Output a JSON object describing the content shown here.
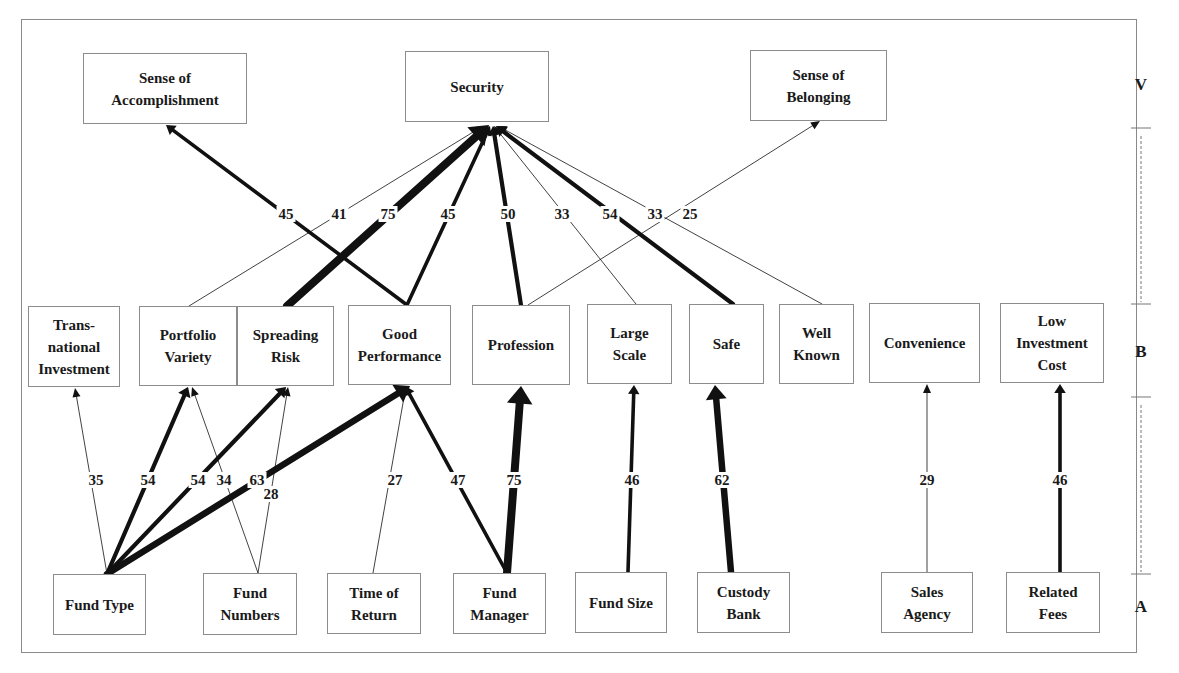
{
  "diagram": {
    "type": "hierarchical-value-map",
    "levels": [
      {
        "id": "V",
        "label": "V",
        "x": 1141,
        "y": 86
      },
      {
        "id": "B",
        "label": "B",
        "x": 1141,
        "y": 353
      },
      {
        "id": "A",
        "label": "A",
        "x": 1141,
        "y": 608
      }
    ],
    "level_brackets": [
      {
        "x": 1141,
        "y1": 128,
        "y2": 304
      },
      {
        "x": 1141,
        "y1": 397,
        "y2": 574
      }
    ],
    "nodes": [
      {
        "id": "accomplishment",
        "label": "Sense of\nAccomplishment",
        "level": "V",
        "x": 83,
        "y": 53,
        "w": 164,
        "h": 71
      },
      {
        "id": "security",
        "label": "Security",
        "level": "V",
        "x": 405,
        "y": 51,
        "w": 144,
        "h": 71
      },
      {
        "id": "belonging",
        "label": "Sense of\nBelonging",
        "level": "V",
        "x": 750,
        "y": 50,
        "w": 137,
        "h": 71
      },
      {
        "id": "transnational",
        "label": "Trans-\nnational\nInvestment",
        "level": "B",
        "x": 28,
        "y": 306,
        "w": 92,
        "h": 81
      },
      {
        "id": "portfolio",
        "label": "Portfolio\nVariety",
        "level": "B",
        "x": 139,
        "y": 306,
        "w": 98,
        "h": 80
      },
      {
        "id": "spreading",
        "label": "Spreading\nRisk",
        "level": "B",
        "x": 237,
        "y": 306,
        "w": 97,
        "h": 80
      },
      {
        "id": "performance",
        "label": "Good\nPerformance",
        "level": "B",
        "x": 348,
        "y": 305,
        "w": 103,
        "h": 80
      },
      {
        "id": "profession",
        "label": "Profession",
        "level": "B",
        "x": 472,
        "y": 305,
        "w": 98,
        "h": 80
      },
      {
        "id": "largescale",
        "label": "Large\nScale",
        "level": "B",
        "x": 587,
        "y": 304,
        "w": 85,
        "h": 80
      },
      {
        "id": "safe",
        "label": "Safe",
        "level": "B",
        "x": 689,
        "y": 304,
        "w": 75,
        "h": 80
      },
      {
        "id": "wellknown",
        "label": "Well\nKnown",
        "level": "B",
        "x": 779,
        "y": 304,
        "w": 75,
        "h": 80
      },
      {
        "id": "convenience",
        "label": "Convenience",
        "level": "B",
        "x": 869,
        "y": 303,
        "w": 111,
        "h": 80
      },
      {
        "id": "lowcost",
        "label": "Low\nInvestment\nCost",
        "level": "B",
        "x": 1000,
        "y": 303,
        "w": 104,
        "h": 80
      },
      {
        "id": "fundtype",
        "label": "Fund Type",
        "level": "A",
        "x": 53,
        "y": 574,
        "w": 93,
        "h": 61
      },
      {
        "id": "fundnumbers",
        "label": "Fund\nNumbers",
        "level": "A",
        "x": 203,
        "y": 573,
        "w": 94,
        "h": 62
      },
      {
        "id": "timereturn",
        "label": "Time of\nReturn",
        "level": "A",
        "x": 327,
        "y": 573,
        "w": 94,
        "h": 61
      },
      {
        "id": "fundmanager",
        "label": "Fund\nManager",
        "level": "A",
        "x": 453,
        "y": 573,
        "w": 93,
        "h": 61
      },
      {
        "id": "fundsize",
        "label": "Fund Size",
        "level": "A",
        "x": 575,
        "y": 572,
        "w": 92,
        "h": 61
      },
      {
        "id": "custody",
        "label": "Custody\nBank",
        "level": "A",
        "x": 697,
        "y": 572,
        "w": 93,
        "h": 61
      },
      {
        "id": "salesagency",
        "label": "Sales\nAgency",
        "level": "A",
        "x": 881,
        "y": 572,
        "w": 92,
        "h": 61
      },
      {
        "id": "relatedfees",
        "label": "Related\nFees",
        "level": "A",
        "x": 1006,
        "y": 572,
        "w": 94,
        "h": 61
      }
    ],
    "edges": [
      {
        "from": "performance",
        "to": "accomplishment",
        "value": 45,
        "x1": 407,
        "y1": 305,
        "x2": 166,
        "y2": 125,
        "lx": 286,
        "ly": 214
      },
      {
        "from": "portfolio",
        "to": "security",
        "value": 41,
        "x1": 189,
        "y1": 306,
        "x2": 483,
        "y2": 126,
        "lx": 339,
        "ly": 214
      },
      {
        "from": "spreading",
        "to": "security",
        "value": 75,
        "x1": 287,
        "y1": 306,
        "x2": 489,
        "y2": 125,
        "lx": 388,
        "ly": 214
      },
      {
        "from": "performance",
        "to": "security",
        "value": 45,
        "x1": 407,
        "y1": 305,
        "x2": 490,
        "y2": 126,
        "lx": 448,
        "ly": 214
      },
      {
        "from": "profession",
        "to": "security",
        "value": 50,
        "x1": 521,
        "y1": 305,
        "x2": 493,
        "y2": 126,
        "lx": 508,
        "ly": 214
      },
      {
        "from": "largescale",
        "to": "security",
        "value": 33,
        "x1": 636,
        "y1": 304,
        "x2": 494,
        "y2": 126,
        "lx": 562,
        "ly": 214
      },
      {
        "from": "safe",
        "to": "security",
        "value": 54,
        "x1": 733,
        "y1": 304,
        "x2": 496,
        "y2": 126,
        "lx": 610,
        "ly": 214
      },
      {
        "from": "wellknown",
        "to": "security",
        "value": 33,
        "x1": 822,
        "y1": 304,
        "x2": 498,
        "y2": 126,
        "lx": 655,
        "ly": 214
      },
      {
        "from": "profession",
        "to": "belonging",
        "value": 25,
        "x1": 528,
        "y1": 305,
        "x2": 820,
        "y2": 121,
        "lx": 690,
        "ly": 214
      },
      {
        "from": "fundtype",
        "to": "transnational",
        "value": 35,
        "x1": 107,
        "y1": 574,
        "x2": 75,
        "y2": 388,
        "lx": 96,
        "ly": 480
      },
      {
        "from": "fundtype",
        "to": "portfolio",
        "value": 54,
        "x1": 107,
        "y1": 574,
        "x2": 188,
        "y2": 387,
        "lx": 148,
        "ly": 480
      },
      {
        "from": "fundtype",
        "to": "spreading",
        "value": 54,
        "x1": 107,
        "y1": 574,
        "x2": 286,
        "y2": 387,
        "lx": 198,
        "ly": 480
      },
      {
        "from": "fundnumbers",
        "to": "portfolio",
        "value": 34,
        "x1": 258,
        "y1": 573,
        "x2": 192,
        "y2": 387,
        "lx": 224,
        "ly": 480
      },
      {
        "from": "fundtype",
        "to": "performance",
        "value": 63,
        "x1": 107,
        "y1": 574,
        "x2": 410,
        "y2": 386,
        "lx": 257,
        "ly": 480
      },
      {
        "from": "fundnumbers",
        "to": "spreading",
        "value": 28,
        "x1": 258,
        "y1": 573,
        "x2": 288,
        "y2": 387,
        "lx": 271,
        "ly": 494
      },
      {
        "from": "timereturn",
        "to": "performance",
        "value": 27,
        "x1": 373,
        "y1": 573,
        "x2": 406,
        "y2": 386,
        "lx": 395,
        "ly": 480
      },
      {
        "from": "fundmanager",
        "to": "performance",
        "value": 47,
        "x1": 507,
        "y1": 573,
        "x2": 405,
        "y2": 386,
        "lx": 458,
        "ly": 480
      },
      {
        "from": "fundmanager",
        "to": "profession",
        "value": 75,
        "x1": 507,
        "y1": 573,
        "x2": 521,
        "y2": 386,
        "lx": 514,
        "ly": 480
      },
      {
        "from": "fundsize",
        "to": "largescale",
        "value": 46,
        "x1": 628,
        "y1": 572,
        "x2": 634,
        "y2": 385,
        "lx": 632,
        "ly": 480
      },
      {
        "from": "custody",
        "to": "safe",
        "value": 62,
        "x1": 731,
        "y1": 572,
        "x2": 715,
        "y2": 385,
        "lx": 722,
        "ly": 480
      },
      {
        "from": "salesagency",
        "to": "convenience",
        "value": 29,
        "x1": 927,
        "y1": 572,
        "x2": 927,
        "y2": 384,
        "lx": 927,
        "ly": 480
      },
      {
        "from": "relatedfees",
        "to": "lowcost",
        "value": 46,
        "x1": 1060,
        "y1": 572,
        "x2": 1060,
        "y2": 384,
        "lx": 1060,
        "ly": 480
      }
    ]
  },
  "style": {
    "line_color": "#111111",
    "box_border": "#8c8c8c",
    "bracket_color": "#777777"
  }
}
